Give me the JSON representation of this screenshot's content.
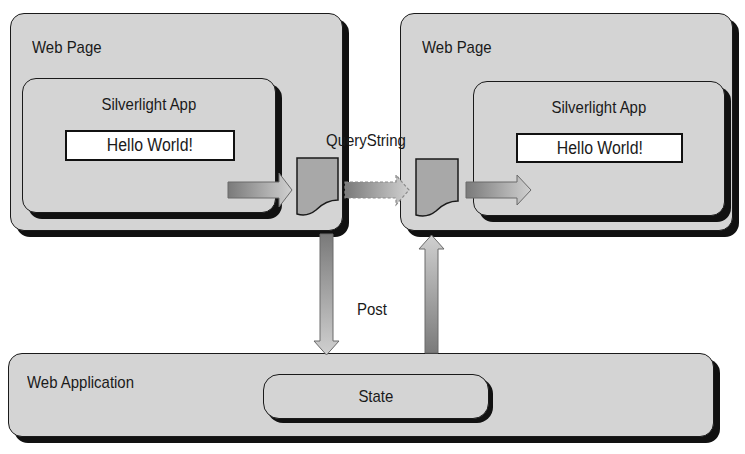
{
  "diagram": {
    "left_page": {
      "title": "Web Page",
      "app": {
        "title": "Silverlight App",
        "content": "Hello World!"
      }
    },
    "right_page": {
      "title": "Web Page",
      "app": {
        "title": "Silverlight App",
        "content": "Hello World!"
      }
    },
    "connectors": {
      "query_string_label": "QueryString",
      "post_label": "Post"
    },
    "web_application": {
      "title": "Web Application",
      "state_label": "State"
    },
    "colors": {
      "box_fill": "#d4d4d4",
      "border": "#1a1a1a",
      "shadow": "#111111",
      "document_fill": "#a8a8a8",
      "arrow_dark": "#7a7a7a",
      "arrow_light": "#cfcfcf"
    }
  }
}
